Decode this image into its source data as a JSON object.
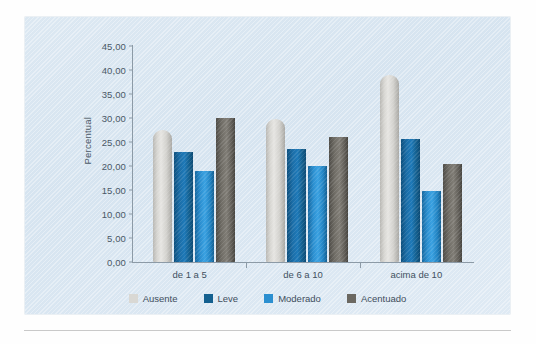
{
  "chart_data": {
    "type": "bar",
    "title": "",
    "xlabel": "",
    "ylabel": "Percentual",
    "categories": [
      "de 1 a 5",
      "de 6 a 10",
      "acima de 10"
    ],
    "ylim": [
      0,
      45
    ],
    "ytick_labels": [
      "45,00",
      "40,00",
      "35,00",
      "30,00",
      "25,00",
      "20,00",
      "15,00",
      "10,00",
      "5,00",
      "0,00"
    ],
    "ytick_values": [
      45,
      40,
      35,
      30,
      25,
      20,
      15,
      10,
      5,
      0
    ],
    "grid": false,
    "legend_position": "bottom",
    "series": [
      {
        "name": "Ausente",
        "color": "#d9d8d4",
        "values": [
          27.5,
          29.8,
          38.9
        ]
      },
      {
        "name": "Leve",
        "color": "#14608f",
        "values": [
          23.0,
          23.5,
          25.7
        ]
      },
      {
        "name": "Moderado",
        "color": "#2b8fd0",
        "values": [
          19.0,
          20.1,
          14.8
        ]
      },
      {
        "name": "Acentuado",
        "color": "#6b6861",
        "values": [
          30.0,
          26.0,
          20.5
        ]
      }
    ]
  },
  "legend": {
    "items": [
      {
        "label": "Ausente",
        "color": "#d9d8d4"
      },
      {
        "label": "Leve",
        "color": "#14608f"
      },
      {
        "label": "Moderado",
        "color": "#2b8fd0"
      },
      {
        "label": "Acentuado",
        "color": "#6b6861"
      }
    ]
  },
  "axis": {
    "y_title": "Percentual"
  }
}
